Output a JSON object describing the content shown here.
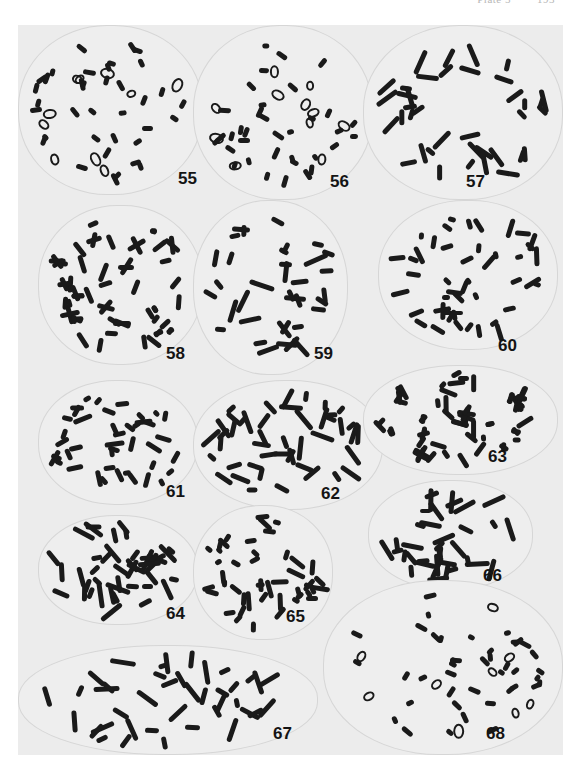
{
  "page": {
    "running_head": {
      "left": "Plate 5",
      "right": "193"
    },
    "colors": {
      "page_background": "#ffffff",
      "plate_background": "#ececec",
      "chromosome": "#1a1a1a",
      "label": "#141414"
    }
  },
  "figures": [
    {
      "id": "55",
      "label": "55",
      "box": [
        0,
        0,
        185,
        170
      ],
      "label_pos": [
        160,
        145
      ],
      "count": 46,
      "shape": "short"
    },
    {
      "id": "56",
      "label": "56",
      "box": [
        175,
        0,
        180,
        175
      ],
      "label_pos": [
        312,
        148
      ],
      "count": 46,
      "shape": "short"
    },
    {
      "id": "57",
      "label": "57",
      "box": [
        345,
        0,
        200,
        175
      ],
      "label_pos": [
        448,
        148
      ],
      "count": 38,
      "shape": "long"
    },
    {
      "id": "58",
      "label": "58",
      "box": [
        20,
        180,
        165,
        160
      ],
      "label_pos": [
        148,
        320
      ],
      "count": 44,
      "shape": "x"
    },
    {
      "id": "59",
      "label": "59",
      "box": [
        175,
        175,
        155,
        175
      ],
      "label_pos": [
        296,
        320
      ],
      "count": 36,
      "shape": "long"
    },
    {
      "id": "60",
      "label": "60",
      "box": [
        360,
        175,
        180,
        150
      ],
      "label_pos": [
        480,
        312
      ],
      "count": 46,
      "shape": "mixed"
    },
    {
      "id": "61",
      "label": "61",
      "box": [
        20,
        355,
        160,
        125
      ],
      "label_pos": [
        148,
        458
      ],
      "count": 42,
      "shape": "mixed"
    },
    {
      "id": "62",
      "label": "62",
      "box": [
        175,
        355,
        190,
        130
      ],
      "label_pos": [
        303,
        460
      ],
      "count": 46,
      "shape": "long"
    },
    {
      "id": "63",
      "label": "63",
      "box": [
        345,
        340,
        195,
        110
      ],
      "label_pos": [
        470,
        423
      ],
      "count": 46,
      "shape": "x"
    },
    {
      "id": "64",
      "label": "64",
      "box": [
        20,
        490,
        160,
        110
      ],
      "label_pos": [
        148,
        580
      ],
      "count": 44,
      "shape": "long"
    },
    {
      "id": "65",
      "label": "65",
      "box": [
        175,
        480,
        140,
        135
      ],
      "label_pos": [
        268,
        583
      ],
      "count": 46,
      "shape": "mixed"
    },
    {
      "id": "66",
      "label": "66",
      "box": [
        350,
        455,
        165,
        110
      ],
      "label_pos": [
        465,
        542
      ],
      "count": 36,
      "shape": "long"
    },
    {
      "id": "67",
      "label": "67",
      "box": [
        0,
        620,
        300,
        110
      ],
      "label_pos": [
        255,
        700
      ],
      "count": 40,
      "shape": "long"
    },
    {
      "id": "68",
      "label": "68",
      "box": [
        305,
        555,
        240,
        175
      ],
      "label_pos": [
        468,
        700
      ],
      "count": 50,
      "shape": "short"
    }
  ]
}
